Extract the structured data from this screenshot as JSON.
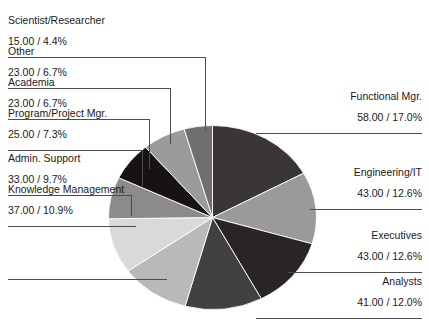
{
  "chart_data": {
    "type": "pie",
    "title": "",
    "subtitle": "",
    "xlabel": "",
    "ylabel": "",
    "legend_position": "callout-labels",
    "grid": false,
    "total": 341.0,
    "value_format": "0.00 / 0.0%",
    "start_angle_deg": 0,
    "direction": "clockwise",
    "categories": [
      "Functional Mgr.",
      "Engineering/IT",
      "Executives",
      "Analysts",
      "Knowledge Management",
      "Admin. Support",
      "Program/Project Mgr.",
      "Academia",
      "Other",
      "Scientist/Researcher"
    ],
    "values": [
      58.0,
      43.0,
      43.0,
      41.0,
      37.0,
      33.0,
      25.0,
      23.0,
      23.0,
      15.0
    ],
    "percents": [
      17.0,
      12.6,
      12.6,
      12.0,
      10.9,
      9.7,
      7.3,
      6.7,
      6.7,
      4.4
    ],
    "colors": [
      "#3a3636",
      "#9a9a9a",
      "#2a2424",
      "#414141",
      "#b9b9b9",
      "#d9d9d9",
      "#8b8b8b",
      "#191212",
      "#9b9b9b",
      "#6f6f6f"
    ],
    "slices": [
      {
        "label": "Functional Mgr.",
        "value_text": "58.00 / 17.0%",
        "value": 58.0,
        "percent": 17.0,
        "color": "#3a3636",
        "side": "right"
      },
      {
        "label": "Engineering/IT",
        "value_text": "43.00 / 12.6%",
        "value": 43.0,
        "percent": 12.6,
        "color": "#9a9a9a",
        "side": "right"
      },
      {
        "label": "Executives",
        "value_text": "43.00 / 12.6%",
        "value": 43.0,
        "percent": 12.6,
        "color": "#2a2424",
        "side": "right"
      },
      {
        "label": "Analysts",
        "value_text": "41.00 / 12.0%",
        "value": 41.0,
        "percent": 12.0,
        "color": "#414141",
        "side": "right"
      },
      {
        "label": "Knowledge Management",
        "value_text": "37.00 / 10.9%",
        "value": 37.0,
        "percent": 10.9,
        "color": "#b9b9b9",
        "side": "left"
      },
      {
        "label": "Admin. Support",
        "value_text": "33.00 / 9.7%",
        "value": 33.0,
        "percent": 9.7,
        "color": "#d9d9d9",
        "side": "left"
      },
      {
        "label": "Program/Project Mgr.",
        "value_text": "25.00 / 7.3%",
        "value": 25.0,
        "percent": 7.3,
        "color": "#8b8b8b",
        "side": "left"
      },
      {
        "label": "Academia",
        "value_text": "23.00 / 6.7%",
        "value": 23.0,
        "percent": 6.7,
        "color": "#191212",
        "side": "left"
      },
      {
        "label": "Other",
        "value_text": "23.00 / 6.7%",
        "value": 23.0,
        "percent": 6.7,
        "color": "#9b9b9b",
        "side": "left"
      },
      {
        "label": "Scientist/Researcher",
        "value_text": "15.00 / 4.4%",
        "value": 15.0,
        "percent": 4.4,
        "color": "#6f6f6f",
        "side": "left"
      }
    ]
  },
  "labels": {
    "scientist_researcher": {
      "name": "Scientist/Researcher",
      "value": "15.00 / 4.4%"
    },
    "other": {
      "name": "Other",
      "value": "23.00 / 6.7%"
    },
    "academia": {
      "name": "Academia",
      "value": "23.00 / 6.7%"
    },
    "program_project_mgr": {
      "name": "Program/Project Mgr.",
      "value": "25.00 / 7.3%"
    },
    "admin_support": {
      "name": "Admin. Support",
      "value": "33.00 / 9.7%"
    },
    "knowledge_management": {
      "name": "Knowledge Management",
      "value": "37.00 / 10.9%"
    },
    "functional_mgr": {
      "name": "Functional Mgr.",
      "value": "58.00 / 17.0%"
    },
    "engineering_it": {
      "name": "Engineering/IT",
      "value": "43.00 / 12.6%"
    },
    "executives": {
      "name": "Executives",
      "value": "43.00 / 12.6%"
    },
    "analysts": {
      "name": "Analysts",
      "value": "41.00 / 12.0%"
    }
  },
  "style": {
    "background": "#ffffff",
    "text_color": "#1a1a1a",
    "leader_color": "#4d4d4d",
    "slice_edge": "#ffffff"
  }
}
